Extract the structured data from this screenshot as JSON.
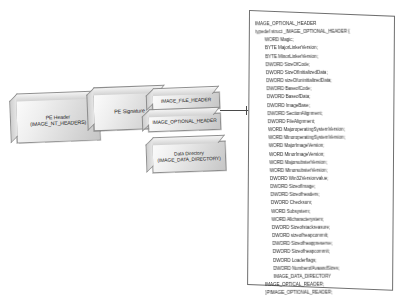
{
  "diagram": {
    "boxes": [
      {
        "name": "pe-header",
        "label": "PE Header\n(IMAGE_NT_HEADERS)"
      },
      {
        "name": "pe-signature",
        "label": "PE Signature"
      },
      {
        "name": "file-header",
        "label": "IMAGE_FILE_HEADER"
      },
      {
        "name": "optional-header",
        "label": "IMAGE_OPTIONAL_HEADER"
      },
      {
        "name": "data-directory",
        "label": "Data Directory\n(IMAGE_DATA_DIRECTORY)"
      }
    ],
    "connector": {
      "name": "optional-header-to-code-connector"
    }
  },
  "code_panel": {
    "heading": "IMAGE_OPTIONAL_HEADER",
    "lines": [
      {
        "text": "IMAGE_OPTIONAL_HEADER",
        "indent": 0
      },
      {
        "text": "typedef struct _IMAGE_OPTIONAL_HEADER {",
        "indent": 0
      },
      {
        "text": "WORD Magic;",
        "indent": 1
      },
      {
        "text": "BYTE MajorLinkerVersion;",
        "indent": 1
      },
      {
        "text": "BYTE MinorLinkerVersion;",
        "indent": 1
      },
      {
        "text": "DWORD SizeOfCode;",
        "indent": 1
      },
      {
        "text": "DWORD SizeOfInitializedData;",
        "indent": 1
      },
      {
        "text": "DWORD sizeOfuninitializedData;",
        "indent": 1
      },
      {
        "text": "DWORD BaseofCode;",
        "indent": 1
      },
      {
        "text": "DWORD BaseofData;",
        "indent": 1
      },
      {
        "text": "DWORD ImageBase;",
        "indent": 1
      },
      {
        "text": "DWORD SectionAlignment;",
        "indent": 1
      },
      {
        "text": "DWORD FileAlignment;",
        "indent": 1
      },
      {
        "text": "WORD MajoroperatingSystemVersion;",
        "indent": 1
      },
      {
        "text": "WORD MinoroperatingSystemVersion;",
        "indent": 1
      },
      {
        "text": "WORD MajorImageVersion;",
        "indent": 1
      },
      {
        "text": "WORD MinorImageVersion;",
        "indent": 1
      },
      {
        "text": "WORD MajorsubsterVersion;",
        "indent": 1
      },
      {
        "text": "WORD MinorsubsterVersion;",
        "indent": 1
      },
      {
        "text": "DWORD Win32Versionvalue;",
        "indent": 1
      },
      {
        "text": "DWORD SizeofImage;",
        "indent": 1
      },
      {
        "text": "DWORD Sizeofheaders;",
        "indent": 1
      },
      {
        "text": "DWORD Checksum;",
        "indent": 1
      },
      {
        "text": "WORD Subsystem;",
        "indent": 1
      },
      {
        "text": "WORD Allcharacterystem;",
        "indent": 1
      },
      {
        "text": "DWORD Sizeofstackreasure;",
        "indent": 1
      },
      {
        "text": "DWORD sizeofheapcommit;",
        "indent": 1
      },
      {
        "text": "DWORD Sizeofheappreserve;",
        "indent": 1
      },
      {
        "text": "DWORD Sizeofheapcommit;",
        "indent": 1
      },
      {
        "text": "DWORD Loaderflags;",
        "indent": 1
      },
      {
        "text": "DWORD NumberofAvaandSizes;",
        "indent": 1
      },
      {
        "text": "IMAGE_DATA_DIRECTORY",
        "indent": 1
      },
      {
        "text": "IMAGE_OPTICAL_READER;",
        "indent": 0
      },
      {
        "text": "}PIMAGE_OPTIONAL_READER;",
        "indent": 0
      }
    ]
  },
  "colors": {
    "background": "#ffffff",
    "slab_border": "#8d8d8d",
    "panel_border": "#6f6f6f",
    "connector": "#4a4a4a",
    "text": "#2a2a2a"
  }
}
